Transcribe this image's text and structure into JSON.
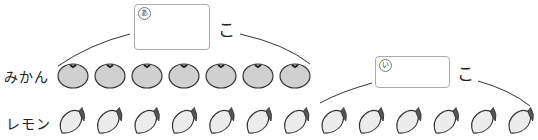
{
  "problem": {
    "box_a": {
      "mark": "あ",
      "unit": "こ"
    },
    "box_i": {
      "mark": "い",
      "unit": "こ"
    },
    "rows": [
      {
        "label": "みかん",
        "item": "orange",
        "count": 7
      },
      {
        "label": "レモン",
        "item": "lemon",
        "count": 14
      }
    ],
    "colors": {
      "orange_fill": "#d0d0d0",
      "lemon_fill": "#ececec",
      "line": "#333333",
      "box_border": "#aaaaaa"
    }
  }
}
